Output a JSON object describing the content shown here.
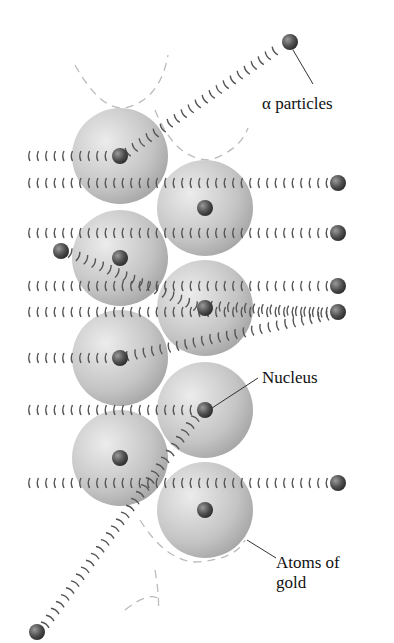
{
  "diagram": {
    "labels": {
      "alpha": "α particles",
      "nucleus": "Nucleus",
      "atoms_line1": "Atoms of",
      "atoms_line2": "gold"
    },
    "colors": {
      "atom": "#c8c8c8",
      "nucleus": "#555555",
      "wave": "#555555",
      "dashed": "#bbbbbb"
    },
    "atoms": [
      {
        "cx": 120,
        "cy": 156
      },
      {
        "cx": 205,
        "cy": 208
      },
      {
        "cx": 120,
        "cy": 258
      },
      {
        "cx": 205,
        "cy": 308
      },
      {
        "cx": 120,
        "cy": 358
      },
      {
        "cx": 205,
        "cy": 410
      },
      {
        "cx": 120,
        "cy": 458
      },
      {
        "cx": 205,
        "cy": 510
      }
    ],
    "particles": [
      {
        "x": 338,
        "y": 183
      },
      {
        "x": 338,
        "y": 233
      },
      {
        "x": 338,
        "y": 286
      },
      {
        "x": 338,
        "y": 312
      },
      {
        "x": 338,
        "y": 483
      },
      {
        "x": 290,
        "y": 42
      },
      {
        "x": 61,
        "y": 251
      },
      {
        "x": 37,
        "y": 632
      }
    ]
  }
}
